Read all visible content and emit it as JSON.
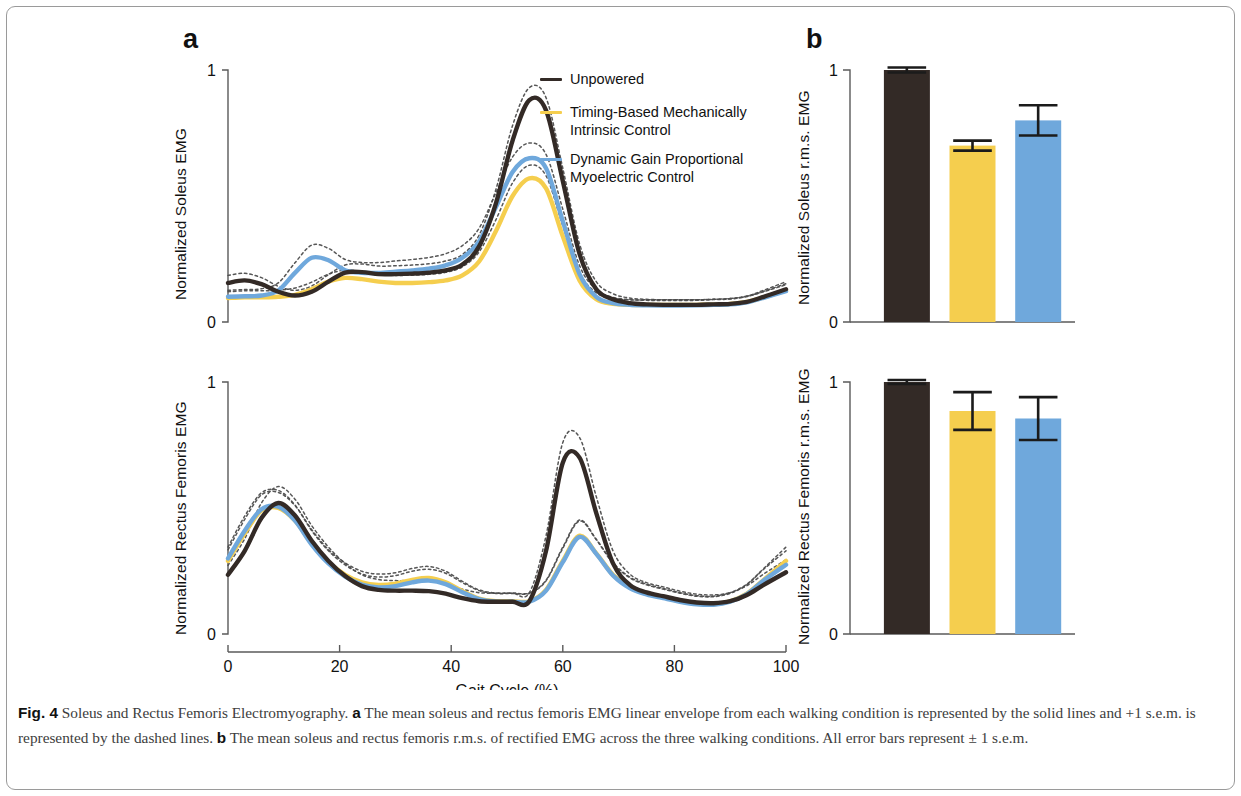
{
  "figure": {
    "panel_a_letter": "a",
    "panel_b_letter": "b",
    "border_color": "#9a9a9a",
    "background": "#ffffff"
  },
  "colors": {
    "unpowered": "#332a26",
    "timing_based": "#f5ce4e",
    "dynamic_gain": "#6fa8dc",
    "axis": "#5a5a5a",
    "dashed": "#4d4d4d"
  },
  "legend": {
    "items": [
      {
        "label": "Unpowered",
        "color_key": "unpowered"
      },
      {
        "label": "Timing-Based Mechanically\nIntrinsic Control",
        "color_key": "timing_based"
      },
      {
        "label": "Dynamic Gain Proportional\nMyoelectric Control",
        "color_key": "dynamic_gain"
      }
    ]
  },
  "axes": {
    "x_title": "Gait Cycle (%)",
    "x_ticks": [
      "0",
      "20",
      "40",
      "60",
      "80",
      "100"
    ],
    "x_tick_values": [
      0,
      20,
      40,
      60,
      80,
      100
    ],
    "y_ticks": [
      "0",
      "1"
    ],
    "soleus_ylabel": "Normalized Soleus EMG",
    "rectus_ylabel": "Normalized Rectus Femoris EMG",
    "soleus_bar_ylabel": "Normalized Soleus r.m.s. EMG",
    "rectus_bar_ylabel": "Normalized Rectus Femoris r.m.s. EMG"
  },
  "caption": {
    "fig_label": "Fig. 4",
    "title": "Soleus and Rectus Femoris Electromyography.",
    "a_marker": "a",
    "a_text": "The mean soleus and rectus femoris EMG linear envelope from each walking condition is represented by the solid lines and +1 s.e.m. is represented by the dashed lines.",
    "b_marker": "b",
    "b_text": "The mean soleus and rectus femoris r.m.s. of rectified EMG across the three walking conditions. All error bars represent ± 1 s.e.m."
  },
  "chart_data": [
    {
      "type": "line",
      "id": "soleus-line",
      "title": "",
      "xlabel": "Gait Cycle (%)",
      "ylabel": "Normalized Soleus EMG",
      "xlim": [
        0,
        100
      ],
      "ylim": [
        0,
        1
      ],
      "grid": false,
      "legend_position": "upper-right",
      "x": [
        0,
        3,
        6,
        9,
        12,
        15,
        18,
        21,
        24,
        27,
        30,
        33,
        36,
        39,
        42,
        45,
        48,
        51,
        54,
        57,
        60,
        63,
        66,
        69,
        72,
        75,
        78,
        81,
        84,
        87,
        90,
        93,
        96,
        100
      ],
      "series": [
        {
          "name": "Unpowered",
          "color": "#332a26",
          "values": [
            0.155,
            0.165,
            0.15,
            0.12,
            0.105,
            0.12,
            0.16,
            0.196,
            0.198,
            0.19,
            0.19,
            0.192,
            0.196,
            0.205,
            0.228,
            0.3,
            0.47,
            0.72,
            0.88,
            0.84,
            0.56,
            0.27,
            0.13,
            0.09,
            0.075,
            0.07,
            0.068,
            0.068,
            0.068,
            0.07,
            0.072,
            0.08,
            0.1,
            0.13
          ],
          "sem_upper": [
            0.185,
            0.193,
            0.176,
            0.142,
            0.126,
            0.143,
            0.188,
            0.226,
            0.23,
            0.222,
            0.223,
            0.226,
            0.231,
            0.242,
            0.268,
            0.345,
            0.525,
            0.78,
            0.93,
            0.89,
            0.61,
            0.31,
            0.16,
            0.112,
            0.095,
            0.09,
            0.088,
            0.088,
            0.088,
            0.09,
            0.093,
            0.103,
            0.126,
            0.16
          ]
        },
        {
          "name": "Timing-Based Mechanically Intrinsic Control",
          "color": "#f5ce4e",
          "values": [
            0.095,
            0.098,
            0.098,
            0.1,
            0.108,
            0.13,
            0.16,
            0.175,
            0.17,
            0.16,
            0.155,
            0.155,
            0.158,
            0.165,
            0.185,
            0.24,
            0.36,
            0.5,
            0.57,
            0.53,
            0.34,
            0.165,
            0.09,
            0.072,
            0.068,
            0.068,
            0.068,
            0.068,
            0.068,
            0.07,
            0.072,
            0.08,
            0.098,
            0.125
          ],
          "sem_upper": [
            0.12,
            0.124,
            0.124,
            0.126,
            0.135,
            0.158,
            0.19,
            0.206,
            0.2,
            0.19,
            0.185,
            0.186,
            0.189,
            0.197,
            0.219,
            0.278,
            0.405,
            0.552,
            0.622,
            0.58,
            0.382,
            0.196,
            0.116,
            0.094,
            0.088,
            0.088,
            0.088,
            0.088,
            0.088,
            0.09,
            0.093,
            0.102,
            0.122,
            0.152
          ]
        },
        {
          "name": "Dynamic Gain Proportional Myoelectric Control",
          "color": "#6fa8dc",
          "values": [
            0.1,
            0.102,
            0.105,
            0.125,
            0.195,
            0.255,
            0.245,
            0.205,
            0.195,
            0.195,
            0.2,
            0.205,
            0.212,
            0.225,
            0.255,
            0.32,
            0.455,
            0.595,
            0.65,
            0.61,
            0.4,
            0.19,
            0.1,
            0.075,
            0.068,
            0.066,
            0.065,
            0.065,
            0.066,
            0.068,
            0.07,
            0.078,
            0.096,
            0.122
          ],
          "sem_upper": [
            0.126,
            0.129,
            0.132,
            0.155,
            0.235,
            0.305,
            0.292,
            0.248,
            0.236,
            0.236,
            0.242,
            0.248,
            0.256,
            0.271,
            0.303,
            0.372,
            0.512,
            0.655,
            0.71,
            0.665,
            0.448,
            0.224,
            0.128,
            0.098,
            0.089,
            0.086,
            0.085,
            0.085,
            0.086,
            0.089,
            0.091,
            0.101,
            0.12,
            0.148
          ]
        }
      ]
    },
    {
      "type": "line",
      "id": "rectus-line",
      "title": "",
      "xlabel": "Gait Cycle (%)",
      "ylabel": "Normalized Rectus Femoris EMG",
      "xlim": [
        0,
        100
      ],
      "ylim": [
        0,
        1
      ],
      "grid": false,
      "x": [
        0,
        3,
        6,
        9,
        12,
        15,
        18,
        21,
        24,
        27,
        30,
        33,
        36,
        39,
        42,
        45,
        48,
        51,
        54,
        57,
        60,
        63,
        66,
        69,
        72,
        75,
        78,
        81,
        84,
        87,
        90,
        93,
        96,
        100
      ],
      "series": [
        {
          "name": "Unpowered",
          "color": "#332a26",
          "values": [
            0.235,
            0.33,
            0.46,
            0.52,
            0.47,
            0.37,
            0.29,
            0.23,
            0.19,
            0.175,
            0.172,
            0.172,
            0.17,
            0.16,
            0.142,
            0.13,
            0.128,
            0.128,
            0.13,
            0.33,
            0.68,
            0.7,
            0.48,
            0.28,
            0.195,
            0.165,
            0.15,
            0.135,
            0.125,
            0.122,
            0.13,
            0.155,
            0.195,
            0.245
          ],
          "sem_upper": [
            0.272,
            0.378,
            0.52,
            0.585,
            0.535,
            0.43,
            0.345,
            0.28,
            0.235,
            0.216,
            0.212,
            0.212,
            0.21,
            0.198,
            0.178,
            0.164,
            0.162,
            0.162,
            0.164,
            0.39,
            0.76,
            0.78,
            0.545,
            0.33,
            0.238,
            0.204,
            0.187,
            0.17,
            0.158,
            0.155,
            0.164,
            0.192,
            0.238,
            0.295
          ]
        },
        {
          "name": "Timing-Based Mechanically Intrinsic Control",
          "color": "#f5ce4e",
          "values": [
            0.29,
            0.4,
            0.49,
            0.5,
            0.45,
            0.36,
            0.285,
            0.235,
            0.205,
            0.195,
            0.2,
            0.215,
            0.222,
            0.205,
            0.17,
            0.14,
            0.13,
            0.13,
            0.13,
            0.175,
            0.29,
            0.39,
            0.32,
            0.235,
            0.185,
            0.16,
            0.145,
            0.13,
            0.12,
            0.118,
            0.13,
            0.16,
            0.215,
            0.29
          ],
          "sem_upper": [
            0.334,
            0.455,
            0.552,
            0.562,
            0.51,
            0.414,
            0.335,
            0.282,
            0.249,
            0.238,
            0.243,
            0.26,
            0.268,
            0.249,
            0.209,
            0.175,
            0.163,
            0.163,
            0.163,
            0.214,
            0.345,
            0.452,
            0.376,
            0.283,
            0.226,
            0.198,
            0.181,
            0.164,
            0.152,
            0.15,
            0.164,
            0.198,
            0.26,
            0.345
          ]
        },
        {
          "name": "Dynamic Gain Proportional Myoelectric Control",
          "color": "#6fa8dc",
          "values": [
            0.3,
            0.41,
            0.495,
            0.505,
            0.45,
            0.355,
            0.28,
            0.228,
            0.196,
            0.185,
            0.19,
            0.205,
            0.212,
            0.198,
            0.166,
            0.138,
            0.128,
            0.128,
            0.128,
            0.172,
            0.285,
            0.385,
            0.318,
            0.232,
            0.182,
            0.157,
            0.142,
            0.128,
            0.118,
            0.116,
            0.128,
            0.158,
            0.212,
            0.275
          ],
          "sem_upper": [
            0.345,
            0.468,
            0.56,
            0.57,
            0.512,
            0.41,
            0.33,
            0.274,
            0.238,
            0.226,
            0.232,
            0.249,
            0.257,
            0.241,
            0.204,
            0.172,
            0.161,
            0.161,
            0.161,
            0.211,
            0.34,
            0.448,
            0.374,
            0.28,
            0.223,
            0.195,
            0.178,
            0.162,
            0.15,
            0.148,
            0.161,
            0.196,
            0.257,
            0.33
          ]
        }
      ]
    },
    {
      "type": "bar",
      "id": "soleus-bar",
      "title": "",
      "ylabel": "Normalized Soleus r.m.s. EMG",
      "ylim": [
        0,
        1
      ],
      "grid": false,
      "categories": [
        "Unpowered",
        "Timing-Based Mechanically Intrinsic Control",
        "Dynamic Gain Proportional Myoelectric Control"
      ],
      "values": [
        1.0,
        0.7,
        0.8
      ],
      "errors": [
        0.01,
        0.02,
        0.06
      ],
      "colors": [
        "#332a26",
        "#f5ce4e",
        "#6fa8dc"
      ]
    },
    {
      "type": "bar",
      "id": "rectus-bar",
      "title": "",
      "ylabel": "Normalized Rectus Femoris r.m.s. EMG",
      "ylim": [
        0,
        1
      ],
      "grid": false,
      "categories": [
        "Unpowered",
        "Timing-Based Mechanically Intrinsic Control",
        "Dynamic Gain Proportional Myoelectric Control"
      ],
      "values": [
        1.0,
        0.885,
        0.855
      ],
      "errors": [
        0.008,
        0.075,
        0.085
      ],
      "colors": [
        "#332a26",
        "#f5ce4e",
        "#6fa8dc"
      ]
    }
  ]
}
